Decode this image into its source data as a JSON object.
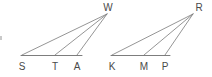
{
  "figure": {
    "background_color": "#ffffff",
    "line_color": "#7a7a7a",
    "label_color": "#4a4a4a",
    "width": 212,
    "height": 77,
    "shapes": [
      {
        "name": "left-triangle",
        "apex": {
          "label": "W",
          "x": 107,
          "y": 14,
          "label_x": 108,
          "label_y": 11
        },
        "base_points": [
          {
            "label": "S",
            "x": 22,
            "y": 55,
            "label_x": 22,
            "label_y": 70
          },
          {
            "label": "T",
            "x": 55,
            "y": 55,
            "label_x": 55,
            "label_y": 70
          },
          {
            "label": "A",
            "x": 77,
            "y": 55,
            "label_x": 77,
            "label_y": 70
          }
        ],
        "base_line": {
          "x1": 21,
          "y1": 55.5,
          "x2": 82,
          "y2": 55.5
        }
      },
      {
        "name": "right-triangle",
        "apex": {
          "label": "R",
          "x": 193,
          "y": 14,
          "label_x": 199,
          "label_y": 11
        },
        "base_points": [
          {
            "label": "K",
            "x": 112,
            "y": 55,
            "label_x": 112,
            "label_y": 70
          },
          {
            "label": "M",
            "x": 144,
            "y": 55,
            "label_x": 144,
            "label_y": 70
          },
          {
            "label": "P",
            "x": 165,
            "y": 55,
            "label_x": 165,
            "label_y": 70
          }
        ],
        "base_line": {
          "x1": 111,
          "y1": 55.5,
          "x2": 170,
          "y2": 55.5
        }
      }
    ]
  }
}
